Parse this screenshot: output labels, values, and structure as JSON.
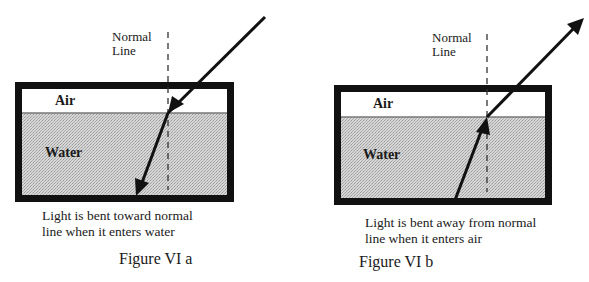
{
  "figures": [
    {
      "id": "a",
      "normal_label": [
        "Normal",
        "Line"
      ],
      "air_label": "Air",
      "water_label": "Water",
      "caption": [
        "Light is bent toward normal",
        "line when it enters water"
      ],
      "title": "Figure VI a"
    },
    {
      "id": "b",
      "normal_label": [
        "Normal",
        "Line"
      ],
      "air_label": "Air",
      "water_label": "Water",
      "caption": [
        "Light is bent away from normal",
        "line when it enters air"
      ],
      "title": "Figure VI b"
    }
  ],
  "colors": {
    "frame": "#111111",
    "water_fill": "#c8c8c8",
    "air_fill": "#ffffff",
    "ray": "#111111"
  }
}
